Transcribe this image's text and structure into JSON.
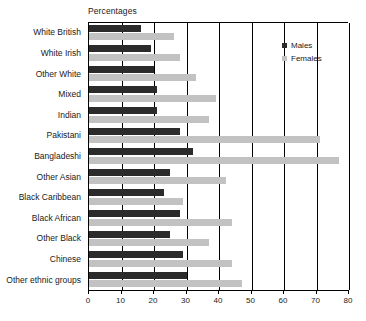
{
  "chart_data": {
    "type": "bar",
    "orientation": "horizontal",
    "title": "Percentages",
    "xlabel": "",
    "ylabel": "",
    "xlim": [
      0,
      80
    ],
    "xticks": [
      0,
      10,
      20,
      30,
      40,
      50,
      60,
      70,
      80
    ],
    "grid": true,
    "grid_axis": "x",
    "legend_position": "top-right",
    "categories": [
      "White British",
      "White Irish",
      "Other White",
      "Mixed",
      "Indian",
      "Pakistani",
      "Bangladeshi",
      "Other Asian",
      "Black Caribbean",
      "Black African",
      "Other Black",
      "Chinese",
      "Other ethnic groups"
    ],
    "series": [
      {
        "name": "Males",
        "color": "#2b2b2b",
        "values": [
          16,
          19,
          20,
          21,
          21,
          28,
          32,
          25,
          23,
          28,
          25,
          29,
          30
        ]
      },
      {
        "name": "Females",
        "color": "#c2c2c2",
        "values": [
          26,
          28,
          33,
          39,
          37,
          71,
          77,
          42,
          29,
          44,
          37,
          44,
          47
        ]
      }
    ]
  },
  "legend": {
    "items": [
      {
        "label": "Males",
        "swatch": "male"
      },
      {
        "label": "Females",
        "swatch": "female"
      }
    ]
  },
  "axis": {
    "tick_labels": [
      "0",
      "10",
      "20",
      "30",
      "40",
      "50",
      "60",
      "70",
      "80"
    ]
  },
  "colors": {
    "males": "#2b2b2b",
    "females": "#c2c2c2",
    "axis": "#000000",
    "background": "#ffffff"
  }
}
